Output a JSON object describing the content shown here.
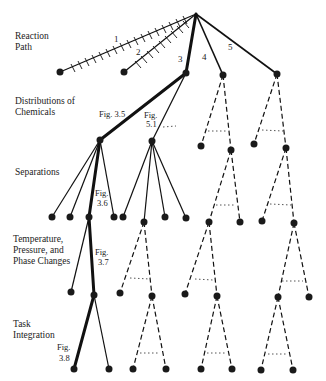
{
  "levels": [
    {
      "label_lines": [
        "Reaction",
        "Path"
      ],
      "y": 35
    },
    {
      "label_lines": [
        "Distributions of",
        "Chemicals"
      ],
      "y": 100
    },
    {
      "label_lines": [
        "Separations"
      ],
      "y": 172
    },
    {
      "label_lines": [
        "Temperature,",
        "Pressure, and",
        "Phase Changes"
      ],
      "y": 242
    },
    {
      "label_lines": [
        "Task",
        "Integration"
      ],
      "y": 325
    }
  ],
  "branch_numbers": [
    "1",
    "2",
    "3",
    "4",
    "5"
  ],
  "figure_refs": {
    "fig_3_5": "Fig. 3.5",
    "fig_5_1_a": "Fig.",
    "fig_5_1_b": "5.1",
    "fig_3_6_a": "Fig.",
    "fig_3_6_b": "3.6",
    "fig_3_7_a": "Fig.",
    "fig_3_7_b": "3.7",
    "fig_3_8_a": "Fig.",
    "fig_3_8_b": "3.8"
  },
  "colors": {
    "line": "#111111",
    "node": "#1a1a1a",
    "background": "#ffffff"
  }
}
